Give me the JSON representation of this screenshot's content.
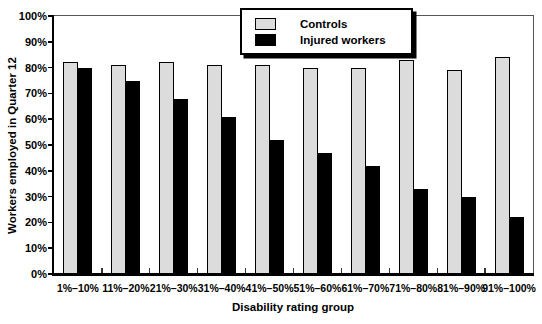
{
  "chart_data": {
    "type": "bar",
    "categories": [
      "1%–10%",
      "11%–20%",
      "21%–30%",
      "31%–40%",
      "41%–50%",
      "51%–60%",
      "61%–70%",
      "71%–80%",
      "81%–90%",
      "91%–100%"
    ],
    "series": [
      {
        "name": "Controls",
        "color": "#dcdcdc",
        "values": [
          82,
          81,
          82,
          81,
          81,
          80,
          80,
          83,
          79,
          84
        ]
      },
      {
        "name": "Injured workers",
        "color": "#000000",
        "values": [
          80,
          75,
          68,
          61,
          52,
          47,
          42,
          33,
          30,
          22
        ]
      }
    ],
    "xlabel": "Disability rating group",
    "ylabel": "Workers employed in Quarter 12",
    "ylim": [
      0,
      100
    ],
    "ytick_step": 10,
    "ytick_suffix": "%",
    "grid": false,
    "legend_position": "top-center",
    "bar_border_color": "#000000",
    "axis_color": "#000000",
    "frame_color": "#555555"
  }
}
